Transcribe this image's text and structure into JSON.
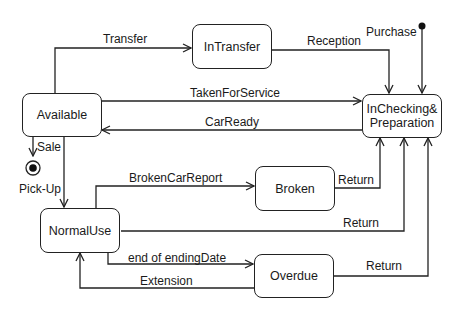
{
  "diagram": {
    "type": "uml-state-machine",
    "states": [
      {
        "id": "available",
        "label": "Available"
      },
      {
        "id": "intransfer",
        "label": "InTransfer"
      },
      {
        "id": "inchecking",
        "label": "InChecking&\nPreparation"
      },
      {
        "id": "normaluse",
        "label": "NormalUse"
      },
      {
        "id": "broken",
        "label": "Broken"
      },
      {
        "id": "overdue",
        "label": "Overdue"
      }
    ],
    "pseudostates": {
      "initial": {
        "target": "inchecking"
      },
      "final": {
        "source": "available"
      }
    },
    "transitions": [
      {
        "from": "available",
        "to": "intransfer",
        "label": "Transfer"
      },
      {
        "from": "intransfer",
        "to": "inchecking",
        "label": "Reception"
      },
      {
        "from": "initial",
        "to": "inchecking",
        "label": "Purchase"
      },
      {
        "from": "available",
        "to": "inchecking",
        "label": "TakenForService"
      },
      {
        "from": "inchecking",
        "to": "available",
        "label": "CarReady"
      },
      {
        "from": "available",
        "to": "final",
        "label": "Sale"
      },
      {
        "from": "available",
        "to": "normaluse",
        "label": "Pick-Up"
      },
      {
        "from": "normaluse",
        "to": "broken",
        "label": "BrokenCarReport"
      },
      {
        "from": "broken",
        "to": "inchecking",
        "label": "Return"
      },
      {
        "from": "normaluse",
        "to": "inchecking",
        "label": "Return"
      },
      {
        "from": "normaluse",
        "to": "overdue",
        "label": "end of endingDate"
      },
      {
        "from": "overdue",
        "to": "normaluse",
        "label": "Extension"
      },
      {
        "from": "overdue",
        "to": "inchecking",
        "label": "Return"
      }
    ]
  },
  "states": {
    "available": "Available",
    "intransfer": "InTransfer",
    "inchecking_line1": "InChecking&",
    "inchecking_line2": "Preparation",
    "normaluse": "NormalUse",
    "broken": "Broken",
    "overdue": "Overdue"
  },
  "labels": {
    "transfer": "Transfer",
    "reception": "Reception",
    "purchase": "Purchase",
    "taken_for_service": "TakenForService",
    "car_ready": "CarReady",
    "sale": "Sale",
    "pick_up": "Pick-Up",
    "broken_car_report": "BrokenCarReport",
    "return_broken": "Return",
    "return_normal": "Return",
    "end_of_ending_date": "end of endingDate",
    "extension": "Extension",
    "return_overdue": "Return"
  },
  "colors": {
    "line": "#222222",
    "background": "#ffffff"
  }
}
